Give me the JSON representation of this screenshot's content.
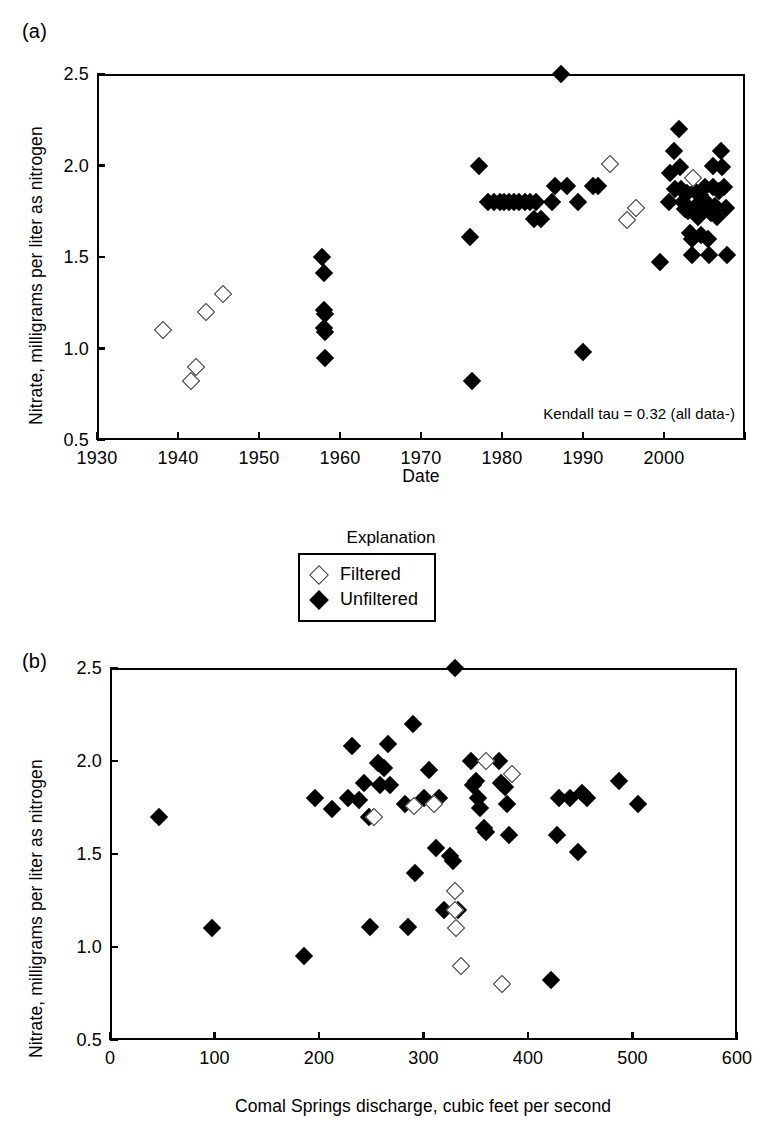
{
  "figure": {
    "panel_a_tag": "(a)",
    "panel_b_tag": "(b)"
  },
  "legend": {
    "title": "Explanation",
    "entries": [
      {
        "label": "Filtered",
        "marker": "open-diamond"
      },
      {
        "label": "Unfiltered",
        "marker": "filled-diamond"
      }
    ]
  },
  "chart_data": [
    {
      "id": "panel-a",
      "type": "scatter",
      "panel": "(a)",
      "title": "",
      "xlabel": "Date",
      "ylabel": "Nitrate, milligrams per liter as nitrogen",
      "xlim": [
        1930,
        2010
      ],
      "ylim": [
        0.5,
        2.5
      ],
      "xticks": [
        1930,
        1940,
        1950,
        1960,
        1970,
        1980,
        1990,
        2000,
        2010
      ],
      "xtick_labels": [
        "1930",
        "1940",
        "1950",
        "1960",
        "1970",
        "1980",
        "1990",
        "2000",
        ""
      ],
      "yticks": [
        0.5,
        1.0,
        1.5,
        2.0,
        2.5
      ],
      "ytick_labels": [
        "0.5",
        "1.0",
        "1.5",
        "2.0",
        "2.5"
      ],
      "grid": false,
      "annotation": "Kendall tau = 0.32 (all data-)",
      "legend_position": "above-panel-b",
      "series": [
        {
          "name": "Filtered",
          "marker": "open-diamond",
          "points": [
            [
              1938.2,
              1.1
            ],
            [
              1941.6,
              0.82
            ],
            [
              1942.2,
              0.9
            ],
            [
              1943.4,
              1.2
            ],
            [
              1945.6,
              1.3
            ],
            [
              1993.3,
              2.01
            ],
            [
              1995.4,
              1.7
            ],
            [
              1996.6,
              1.77
            ],
            [
              2003.6,
              1.93
            ]
          ]
        },
        {
          "name": "Unfiltered",
          "marker": "filled-diamond",
          "points": [
            [
              1957.8,
              1.5
            ],
            [
              1958.0,
              1.41
            ],
            [
              1958.0,
              1.21
            ],
            [
              1958.1,
              1.19
            ],
            [
              1958.0,
              1.11
            ],
            [
              1958.1,
              1.09
            ],
            [
              1958.1,
              0.95
            ],
            [
              1976.0,
              1.61
            ],
            [
              1976.3,
              0.82
            ],
            [
              1977.2,
              2.0
            ],
            [
              1978.3,
              1.8
            ],
            [
              1979.0,
              1.8
            ],
            [
              1979.7,
              1.8
            ],
            [
              1980.3,
              1.8
            ],
            [
              1980.9,
              1.8
            ],
            [
              1981.5,
              1.8
            ],
            [
              1982.1,
              1.8
            ],
            [
              1982.8,
              1.8
            ],
            [
              1983.4,
              1.8
            ],
            [
              1984.2,
              1.8
            ],
            [
              1984.0,
              1.71
            ],
            [
              1984.8,
              1.71
            ],
            [
              1986.2,
              1.8
            ],
            [
              1986.6,
              1.89
            ],
            [
              1987.3,
              2.5
            ],
            [
              1988.0,
              1.89
            ],
            [
              1989.4,
              1.8
            ],
            [
              1990.0,
              0.98
            ],
            [
              1991.2,
              1.89
            ],
            [
              1991.8,
              1.89
            ],
            [
              1999.5,
              1.47
            ],
            [
              2000.6,
              1.8
            ],
            [
              2000.8,
              1.96
            ],
            [
              2001.2,
              2.08
            ],
            [
              2001.3,
              1.87
            ],
            [
              2001.8,
              2.2
            ],
            [
              2002.0,
              1.99
            ],
            [
              2002.1,
              1.87
            ],
            [
              2002.4,
              1.8
            ],
            [
              2002.6,
              1.76
            ],
            [
              2002.8,
              1.85
            ],
            [
              2003.0,
              1.75
            ],
            [
              2003.2,
              1.63
            ],
            [
              2003.4,
              1.6
            ],
            [
              2003.5,
              1.51
            ],
            [
              2003.8,
              1.86
            ],
            [
              2004.0,
              1.78
            ],
            [
              2004.2,
              1.72
            ],
            [
              2004.4,
              1.84
            ],
            [
              2004.6,
              1.62
            ],
            [
              2004.8,
              1.75
            ],
            [
              2005.0,
              1.88
            ],
            [
              2005.2,
              1.8
            ],
            [
              2005.4,
              1.6
            ],
            [
              2005.6,
              1.51
            ],
            [
              2005.8,
              1.74
            ],
            [
              2006.0,
              2.0
            ],
            [
              2006.1,
              1.88
            ],
            [
              2006.3,
              1.78
            ],
            [
              2006.5,
              1.72
            ],
            [
              2006.8,
              1.86
            ],
            [
              2007.0,
              2.08
            ],
            [
              2007.2,
              1.99
            ],
            [
              2007.4,
              1.88
            ],
            [
              2007.6,
              1.77
            ],
            [
              2007.8,
              1.51
            ]
          ]
        }
      ]
    },
    {
      "id": "panel-b",
      "type": "scatter",
      "panel": "(b)",
      "title": "",
      "xlabel": "Comal Springs discharge, cubic feet per second",
      "ylabel": "Nitrate, milligrams per liter as nitrogen",
      "xlim": [
        0,
        600
      ],
      "ylim": [
        0.5,
        2.5
      ],
      "xticks": [
        0,
        100,
        200,
        300,
        400,
        500,
        600
      ],
      "xtick_labels": [
        "0",
        "100",
        "200",
        "300",
        "400",
        "500",
        "600"
      ],
      "yticks": [
        0.5,
        1.0,
        1.5,
        2.0,
        2.5
      ],
      "ytick_labels": [
        "0.5",
        "1.0",
        "1.5",
        "2.0",
        "2.5"
      ],
      "grid": false,
      "annotation": "",
      "series": [
        {
          "name": "Filtered",
          "marker": "open-diamond",
          "points": [
            [
              253,
              1.7
            ],
            [
              291,
              1.76
            ],
            [
              310,
              1.77
            ],
            [
              330,
              1.3
            ],
            [
              330,
              1.2
            ],
            [
              331,
              1.1
            ],
            [
              336,
              0.9
            ],
            [
              360,
              2.0
            ],
            [
              375,
              0.8
            ],
            [
              385,
              1.93
            ]
          ]
        },
        {
          "name": "Unfiltered",
          "marker": "filled-diamond",
          "points": [
            [
              47,
              1.7
            ],
            [
              98,
              1.1
            ],
            [
              186,
              0.95
            ],
            [
              196,
              1.8
            ],
            [
              212,
              1.74
            ],
            [
              228,
              1.8
            ],
            [
              232,
              2.08
            ],
            [
              238,
              1.79
            ],
            [
              243,
              1.88
            ],
            [
              248,
              1.7
            ],
            [
              249,
              1.11
            ],
            [
              256,
              1.99
            ],
            [
              258,
              1.87
            ],
            [
              262,
              1.96
            ],
            [
              266,
              2.09
            ],
            [
              268,
              1.87
            ],
            [
              282,
              1.77
            ],
            [
              285,
              1.11
            ],
            [
              290,
              2.2
            ],
            [
              292,
              1.4
            ],
            [
              300,
              1.8
            ],
            [
              305,
              1.95
            ],
            [
              312,
              1.53
            ],
            [
              315,
              1.8
            ],
            [
              320,
              1.2
            ],
            [
              325,
              1.49
            ],
            [
              328,
              1.46
            ],
            [
              330,
              2.5
            ],
            [
              333,
              1.2
            ],
            [
              345,
              2.0
            ],
            [
              347,
              1.87
            ],
            [
              350,
              1.89
            ],
            [
              352,
              1.8
            ],
            [
              354,
              1.75
            ],
            [
              358,
              1.64
            ],
            [
              360,
              1.62
            ],
            [
              372,
              2.0
            ],
            [
              374,
              1.88
            ],
            [
              378,
              1.86
            ],
            [
              380,
              1.77
            ],
            [
              382,
              1.6
            ],
            [
              422,
              0.82
            ],
            [
              428,
              1.6
            ],
            [
              430,
              1.8
            ],
            [
              440,
              1.8
            ],
            [
              448,
              1.51
            ],
            [
              452,
              1.83
            ],
            [
              456,
              1.8
            ],
            [
              487,
              1.89
            ],
            [
              505,
              1.77
            ]
          ]
        }
      ]
    }
  ]
}
